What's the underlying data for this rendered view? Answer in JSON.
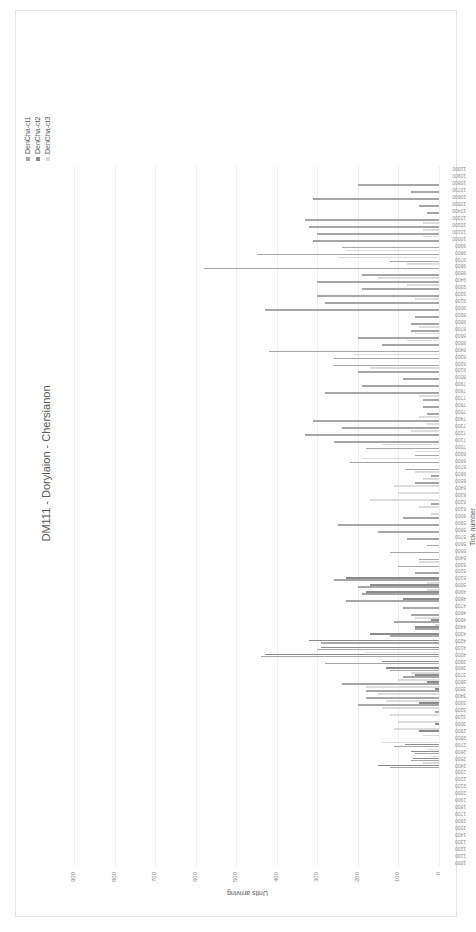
{
  "chart_data": {
    "type": "bar",
    "orientation": "column chart rendered rotated 90deg counter-clockwise",
    "title": "DM111 - Dorylaion - Chersianon",
    "xlabel": "Tick number",
    "ylabel": "Units arriving",
    "ylim": [
      0,
      900
    ],
    "yticks": [
      0,
      100,
      200,
      300,
      400,
      500,
      600,
      700,
      800,
      900
    ],
    "grid": true,
    "legend_position": "top-right",
    "colors": {
      "DenCha-ct1": "#a6a6a6",
      "DenCha-ct2": "#8c8c8c",
      "DenCha-ct3": "#dcdcdc"
    },
    "categories": [
      1000,
      1100,
      1200,
      1300,
      1400,
      1500,
      1600,
      1700,
      1800,
      1900,
      2000,
      2100,
      2200,
      2300,
      2400,
      2500,
      2600,
      2700,
      2800,
      2900,
      3000,
      3100,
      3200,
      3300,
      3400,
      3500,
      3600,
      3700,
      3800,
      3900,
      4000,
      4100,
      4200,
      4300,
      4400,
      4500,
      4600,
      4700,
      4800,
      4900,
      5000,
      5100,
      5200,
      5300,
      5400,
      5500,
      5600,
      5700,
      5800,
      5900,
      6000,
      6100,
      6200,
      6300,
      6400,
      6500,
      6600,
      6700,
      6800,
      6900,
      7000,
      7100,
      7200,
      7300,
      7400,
      7500,
      7600,
      7700,
      7800,
      7900,
      8000,
      8100,
      8200,
      8300,
      8400,
      8500,
      8600,
      8700,
      8800,
      8900,
      9000,
      9100,
      9200,
      9300,
      9400,
      9500,
      9600,
      9700,
      9800,
      9900,
      10000,
      10100,
      10200,
      10300,
      10400,
      10500,
      10600,
      10700,
      10800,
      10900,
      11000
    ],
    "series": [
      {
        "name": "DenCha-ct1",
        "values": [
          0,
          0,
          0,
          0,
          0,
          0,
          0,
          0,
          0,
          0,
          0,
          0,
          0,
          0,
          120,
          70,
          60,
          110,
          0,
          0,
          0,
          0,
          10,
          200,
          180,
          180,
          240,
          90,
          120,
          280,
          440,
          300,
          290,
          120,
          60,
          110,
          70,
          90,
          230,
          190,
          200,
          260,
          60,
          100,
          50,
          120,
          30,
          80,
          150,
          250,
          90,
          0,
          20,
          0,
          0,
          60,
          20,
          85,
          220,
          60,
          180,
          260,
          330,
          240,
          310,
          30,
          40,
          40,
          280,
          190,
          90,
          200,
          260,
          260,
          420,
          140,
          200,
          70,
          70,
          60,
          430,
          280,
          300,
          190,
          300,
          190,
          580,
          120,
          450,
          240,
          310,
          300,
          320,
          330,
          30,
          50,
          310,
          70,
          200,
          0,
          0
        ]
      },
      {
        "name": "DenCha-ct2",
        "values": [
          0,
          0,
          0,
          0,
          0,
          0,
          0,
          0,
          0,
          0,
          0,
          0,
          0,
          0,
          150,
          65,
          70,
          85,
          0,
          50,
          10,
          0,
          0,
          50,
          0,
          10,
          30,
          60,
          130,
          140,
          430,
          290,
          320,
          170,
          60,
          20,
          0,
          0,
          90,
          180,
          170,
          230,
          0,
          0,
          0,
          0,
          0,
          0,
          0,
          0,
          0,
          0,
          0,
          0,
          0,
          0,
          0,
          0,
          0,
          0,
          0,
          0,
          0,
          0,
          0,
          0,
          0,
          0,
          0,
          0,
          0,
          0,
          0,
          0,
          0,
          0,
          0,
          0,
          0,
          0,
          0,
          0,
          0,
          0,
          0,
          0,
          0,
          0,
          0,
          0,
          0,
          0,
          0,
          0,
          0,
          0,
          0,
          0,
          0,
          0,
          0
        ]
      },
      {
        "name": "DenCha-ct3",
        "values": [
          0,
          0,
          0,
          0,
          0,
          0,
          0,
          0,
          0,
          0,
          0,
          0,
          0,
          0,
          40,
          20,
          30,
          140,
          40,
          110,
          100,
          120,
          140,
          130,
          150,
          180,
          100,
          70,
          0,
          0,
          180,
          0,
          0,
          0,
          10,
          60,
          0,
          0,
          0,
          30,
          30,
          0,
          0,
          50,
          0,
          0,
          0,
          0,
          0,
          0,
          20,
          50,
          170,
          100,
          110,
          40,
          60,
          0,
          190,
          60,
          140,
          0,
          70,
          30,
          50,
          0,
          0,
          50,
          0,
          0,
          0,
          170,
          0,
          210,
          0,
          80,
          60,
          50,
          0,
          0,
          0,
          60,
          0,
          80,
          150,
          0,
          80,
          250,
          230,
          0,
          40,
          40,
          40,
          0,
          0,
          0,
          0,
          0,
          0,
          0,
          0
        ]
      }
    ]
  }
}
